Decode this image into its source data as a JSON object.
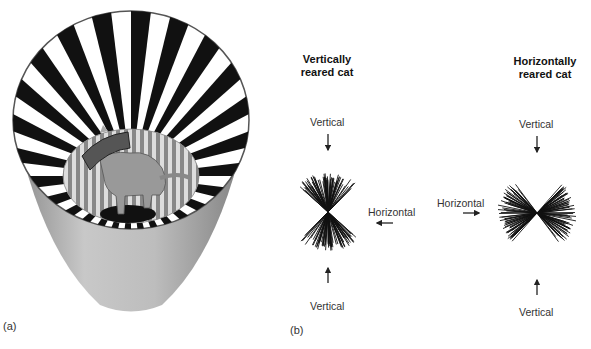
{
  "panel_a": {
    "label": "(a)",
    "description": "Cat inside a cylinder lined with vertical black and white stripes, wearing a collar"
  },
  "panel_b": {
    "label": "(b)",
    "left_plot": {
      "title_line1": "Vertically",
      "title_line2": "reared cat",
      "top_label": "Vertical",
      "bottom_label": "Vertical",
      "side_label": "Horizontal",
      "orientation_bias": "vertical"
    },
    "right_plot": {
      "title_line1": "Horizontally",
      "title_line2": "reared cat",
      "top_label": "Vertical",
      "bottom_label": "Vertical",
      "side_label": "Horizontal",
      "orientation_bias": "horizontal"
    }
  },
  "colors": {
    "stripe_dark": "#111111",
    "cylinder_gray": "#b8b8b8",
    "line": "#111111"
  }
}
